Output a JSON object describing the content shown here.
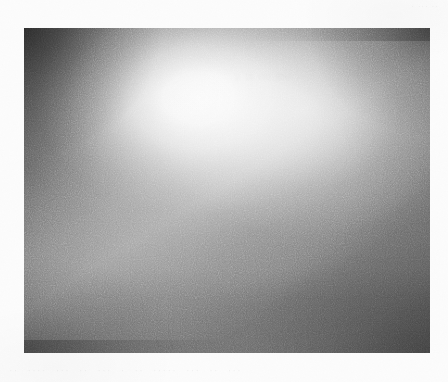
{
  "page": {
    "background_color": "#fcfcfc",
    "width": 448,
    "height": 382
  },
  "figure": {
    "name": "grayscale-photograph",
    "x": 24,
    "y": 28,
    "width": 406,
    "height": 325,
    "caption": "",
    "content_description": "Monochrome photographic plate. A large diffuse luminous highlight occupies the upper-centre-left, fading radially outward; the frame darkens at all four corners and settles into a flat mid-dark grey across the lower third. Heavy scan grain throughout.",
    "tones": {
      "highlight_center": "#f2f2f2",
      "upper_mid": "#c8c8c8",
      "mid_field": "#808080",
      "lower_field": "#6e6e6e",
      "corner_top_left": "#5a5a5a",
      "corner_top_right": "#5c5c5c",
      "border": "#6b6b6b"
    },
    "ghost_text_overlay": "|| ||| |||| |||||"
  },
  "margins": {
    "top_ghost_text": "· ···  ··",
    "bottom_ghost_text": "·· ···· ··· ·· ··· ·  ·· ····· ··· ··  ···"
  }
}
